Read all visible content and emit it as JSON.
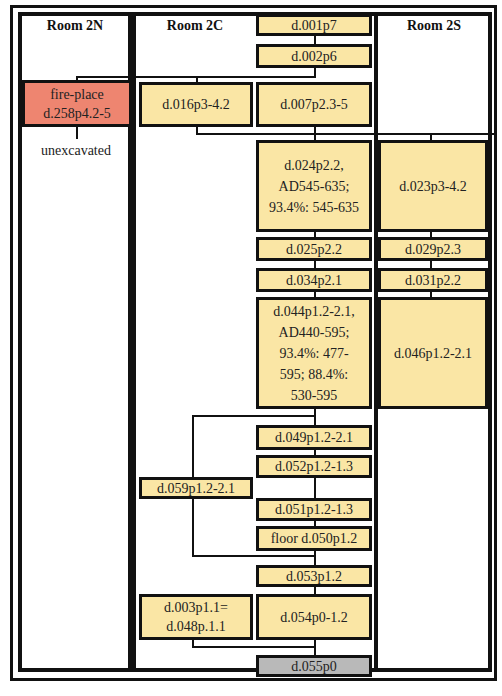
{
  "rooms": {
    "north": {
      "title": "Room 2N"
    },
    "central": {
      "title": "Room 2C"
    },
    "south": {
      "title": "Room 2S"
    }
  },
  "colors": {
    "context_fill": "#fae6a5",
    "fireplace_fill": "#ee8570",
    "base_fill": "#b9b9b9",
    "border": "#111111"
  },
  "contexts": {
    "d001": "d.001p7",
    "d002": "d.002p6",
    "d258": "fire-place\nd.258p4.2-5",
    "d016": "d.016p3-4.2",
    "d007": "d.007p2.3-5",
    "d024": "d.024p2.2,\nAD545-635;\n93.4%: 545-635",
    "d023": "d.023p3-4.2",
    "d025": "d.025p2.2",
    "d029": "d.029p2.3",
    "d034": "d.034p2.1",
    "d031": "d.031p2.2",
    "d044": "d.044p1.2-2.1,\nAD440-595;\n93.4%: 477-\n595; 88.4%:\n530-595",
    "d046": "d.046p1.2-2.1",
    "d049": "d.049p1.2-2.1",
    "d052": "d.052p1.2-1.3",
    "d059": "d.059p1.2-2.1",
    "d051": "d.051p1.2-1.3",
    "d050": "floor d.050p1.2",
    "d053": "d.053p1.2",
    "d003": "d.003p1.1=\nd.048p.1.1",
    "d054": "d.054p0-1.2",
    "d055": "d.055p0"
  },
  "notes": {
    "unexcavated": "unexcavated"
  }
}
